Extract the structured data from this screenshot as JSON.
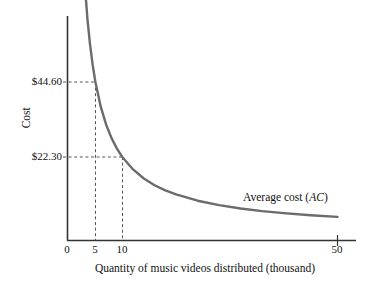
{
  "chart_data": {
    "type": "line",
    "title": "",
    "xlabel": "Quantity of music videos distributed (thousand)",
    "ylabel": "Cost",
    "xlim": [
      0,
      55
    ],
    "ylim": [
      0,
      100
    ],
    "grid": false,
    "legend_position": "inline-annotation",
    "series": [
      {
        "name": "Average cost (AC)",
        "formula": "AC = 223 / Q",
        "x": [
          2.6,
          3,
          3.5,
          4,
          4.5,
          5,
          6,
          7,
          8,
          9,
          10,
          12,
          14,
          16,
          18,
          20,
          24,
          28,
          32,
          36,
          40,
          45,
          50
        ],
        "y": [
          85.8,
          74.3,
          63.7,
          55.8,
          49.6,
          44.6,
          37.2,
          31.9,
          27.9,
          24.8,
          22.3,
          18.6,
          15.9,
          13.9,
          12.4,
          11.2,
          9.3,
          8.0,
          7.0,
          6.2,
          5.6,
          5.0,
          4.5
        ]
      }
    ],
    "x_ticks": [
      {
        "value": 0,
        "label": "0"
      },
      {
        "value": 5,
        "label": "5"
      },
      {
        "value": 10,
        "label": "10"
      },
      {
        "value": 50,
        "label": "50"
      }
    ],
    "y_ticks": [
      {
        "value": 44.6,
        "label": "$44.60"
      },
      {
        "value": 22.3,
        "label": "$22.30"
      }
    ],
    "annotations": [
      {
        "name": "curve-label",
        "text_prefix": "Average cost (",
        "text_italic": "AC",
        "text_suffix": ")"
      }
    ],
    "reference_lines": [
      {
        "name": "reference-5-4460",
        "x": 5,
        "y": 44.6,
        "style": "dashed"
      },
      {
        "name": "reference-10-2230",
        "x": 10,
        "y": 22.3,
        "style": "dashed"
      }
    ],
    "colors": {
      "curve": "#6b6b6b",
      "axis": "#333333",
      "dashed": "#555555",
      "text": "#111111",
      "background": "#ffffff"
    }
  }
}
